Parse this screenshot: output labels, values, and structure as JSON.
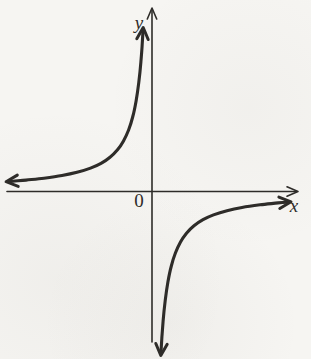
{
  "figure": {
    "labels": {
      "y_axis": "y",
      "x_axis": "x",
      "origin": "0"
    },
    "ink_color": "#2e2c29",
    "paper_color": "#f6f5f2"
  },
  "chart_data": {
    "type": "line",
    "title": "",
    "xlabel": "x",
    "ylabel": "y",
    "xlim": [
      -4.83,
      4.93
    ],
    "ylim": [
      -5.6,
      6.15
    ],
    "grid": false,
    "legend": false,
    "function": "y = k/x with k < 0 (rectangular hyperbola; branches in quadrants II and IV)",
    "asymptotes": {
      "vertical": "x = 0",
      "horizontal": "y = 0"
    },
    "series": [
      {
        "name": "branch-quadrant-II",
        "arrows": "both-ends",
        "x": [
          -4.73,
          -4.2,
          -3.6,
          -3.0,
          -2.5,
          -2.05,
          -1.7,
          -1.4,
          -1.15,
          -0.95,
          -0.78,
          -0.64,
          -0.53,
          -0.44,
          -0.37,
          -0.33,
          -0.3
        ],
        "y": [
          0.338,
          0.381,
          0.444,
          0.533,
          0.64,
          0.78,
          0.941,
          1.143,
          1.391,
          1.684,
          2.051,
          2.5,
          3.019,
          3.636,
          4.324,
          4.848,
          5.333
        ]
      },
      {
        "name": "branch-quadrant-IV",
        "arrows": "both-ends",
        "x": [
          0.3,
          0.33,
          0.37,
          0.44,
          0.53,
          0.64,
          0.78,
          0.95,
          1.15,
          1.4,
          1.7,
          2.05,
          2.5,
          3.0,
          3.6,
          4.2,
          4.5
        ],
        "y": [
          -5.333,
          -4.848,
          -4.324,
          -3.636,
          -3.019,
          -2.5,
          -2.051,
          -1.684,
          -1.391,
          -1.143,
          -0.941,
          -0.78,
          -0.64,
          -0.533,
          -0.444,
          -0.381,
          -0.356
        ]
      }
    ],
    "layout": {
      "origin_px": [
        152,
        191.5
      ],
      "px_per_unit": 30,
      "x_axis_px": [
        7,
        298
      ],
      "y_axis_px": [
        342,
        8
      ]
    }
  }
}
